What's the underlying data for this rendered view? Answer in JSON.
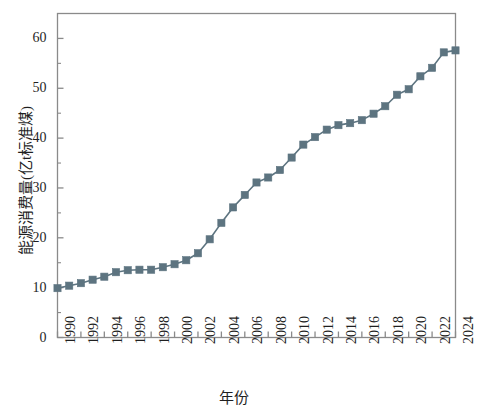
{
  "chart_data": {
    "type": "line",
    "title": "",
    "xlabel": "年份",
    "ylabel": "能源消费量(亿t标准煤)",
    "xlim": [
      1990,
      2024
    ],
    "ylim": [
      0,
      65
    ],
    "grid": false,
    "legend": null,
    "marker": "square",
    "series_color": "#5d7480",
    "x": [
      1990,
      1991,
      1992,
      1993,
      1994,
      1995,
      1996,
      1997,
      1998,
      1999,
      2000,
      2001,
      2002,
      2003,
      2004,
      2005,
      2006,
      2007,
      2008,
      2009,
      2010,
      2011,
      2012,
      2013,
      2014,
      2015,
      2016,
      2017,
      2018,
      2019,
      2020,
      2021,
      2022,
      2023,
      2024
    ],
    "series": [
      {
        "name": "能源消费量",
        "values": [
          9.9,
          10.4,
          10.9,
          11.6,
          12.2,
          13.1,
          13.5,
          13.6,
          13.6,
          14.1,
          14.7,
          15.5,
          16.9,
          19.7,
          23.0,
          26.1,
          28.6,
          31.1,
          32.1,
          33.6,
          36.1,
          38.7,
          40.2,
          41.7,
          42.6,
          43.0,
          43.6,
          44.9,
          46.4,
          48.7,
          49.8,
          52.4,
          54.1,
          57.2,
          57.6
        ]
      }
    ],
    "y_ticks": [
      0,
      10,
      20,
      30,
      40,
      50,
      60
    ],
    "y_minor_ticks": [
      5,
      15,
      25,
      35,
      45,
      55
    ],
    "x_ticks": [
      1990,
      1992,
      1994,
      1996,
      1998,
      2000,
      2002,
      2004,
      2006,
      2008,
      2010,
      2012,
      2014,
      2016,
      2018,
      2020,
      2022,
      2024
    ],
    "axis_color": "#8a8a8a"
  }
}
